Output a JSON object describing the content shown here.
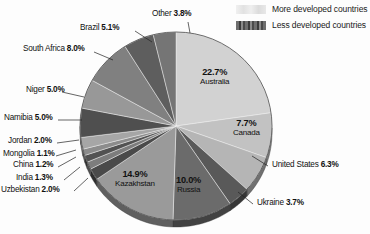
{
  "legend": {
    "position": "top-right",
    "items": [
      {
        "label": "More developed countries",
        "swatch": "light-gray-gradient"
      },
      {
        "label": "Less developed countries",
        "swatch": "dark-gray-striped"
      }
    ]
  },
  "chart_data": {
    "type": "pie",
    "title": "",
    "subtitle": "",
    "xlabel": "",
    "ylabel": "",
    "grid": false,
    "legend_position": "top-right",
    "start_angle_deg": -90,
    "direction": "clockwise",
    "total_percent": 100.0,
    "categories": [
      "Australia",
      "Canada",
      "United States",
      "Ukraine",
      "Russia",
      "Kazakhstan",
      "Uzbekistan",
      "India",
      "China",
      "Mongolia",
      "Jordan",
      "Namibia",
      "Niger",
      "South Africa",
      "Brazil",
      "Other"
    ],
    "values": [
      22.7,
      7.7,
      6.3,
      3.7,
      10.0,
      14.9,
      2.0,
      1.3,
      1.2,
      1.1,
      2.0,
      5.0,
      5.0,
      8.0,
      5.1,
      3.8
    ],
    "slices": [
      {
        "name": "Australia",
        "value": 22.7,
        "label": "22.7%",
        "group": "More developed countries",
        "color": "#d2d2d2",
        "label_placement": "inside"
      },
      {
        "name": "Canada",
        "value": 7.7,
        "label": "7.7%",
        "group": "More developed countries",
        "color": "#c2c2c2",
        "label_placement": "inside"
      },
      {
        "name": "United States",
        "value": 6.3,
        "label": "6.3%",
        "group": "More developed countries",
        "color": "#b5b5b5",
        "label_placement": "outside"
      },
      {
        "name": "Ukraine",
        "value": 3.7,
        "label": "3.7%",
        "group": "Less developed countries",
        "color": "#595959",
        "label_placement": "outside"
      },
      {
        "name": "Russia",
        "value": 10.0,
        "label": "10.0%",
        "group": "Less developed countries",
        "color": "#6b6b6b",
        "label_placement": "inside"
      },
      {
        "name": "Kazakhstan",
        "value": 14.9,
        "label": "14.9%",
        "group": "Less developed countries",
        "color": "#9a9a9a",
        "label_placement": "inside"
      },
      {
        "name": "Uzbekistan",
        "value": 2.0,
        "label": "2.0%",
        "group": "Less developed countries",
        "color": "#4a4a4a",
        "label_placement": "outside"
      },
      {
        "name": "India",
        "value": 1.3,
        "label": "1.3%",
        "group": "Less developed countries",
        "color": "#7d7d7d",
        "label_placement": "outside"
      },
      {
        "name": "China",
        "value": 1.2,
        "label": "1.2%",
        "group": "Less developed countries",
        "color": "#525252",
        "label_placement": "outside"
      },
      {
        "name": "Mongolia",
        "value": 1.1,
        "label": "1.1%",
        "group": "Less developed countries",
        "color": "#8c8c8c",
        "label_placement": "outside"
      },
      {
        "name": "Jordan",
        "value": 2.0,
        "label": "2.0%",
        "group": "Less developed countries",
        "color": "#a6a6a6",
        "label_placement": "outside"
      },
      {
        "name": "Namibia",
        "value": 5.0,
        "label": "5.0%",
        "group": "Less developed countries",
        "color": "#4f4f4f",
        "label_placement": "outside"
      },
      {
        "name": "Niger",
        "value": 5.0,
        "label": "5.0%",
        "group": "Less developed countries",
        "color": "#989898",
        "label_placement": "outside"
      },
      {
        "name": "South Africa",
        "value": 8.0,
        "label": "8.0%",
        "group": "Less developed countries",
        "color": "#808080",
        "label_placement": "outside"
      },
      {
        "name": "Brazil",
        "value": 5.1,
        "label": "5.1%",
        "group": "Less developed countries",
        "color": "#5e5e5e",
        "label_placement": "outside"
      },
      {
        "name": "Other",
        "value": 3.8,
        "label": "3.8%",
        "group": "Less developed countries",
        "color": "#757575",
        "label_placement": "outside"
      }
    ]
  },
  "labels": {
    "other": {
      "name": "Other",
      "pct": "3.8%"
    },
    "brazil": {
      "name": "Brazil",
      "pct": "5.1%"
    },
    "south_africa": {
      "name": "South Africa",
      "pct": "8.0%"
    },
    "niger": {
      "name": "Niger",
      "pct": "5.0%"
    },
    "namibia": {
      "name": "Namibia",
      "pct": "5.0%"
    },
    "jordan": {
      "name": "Jordan",
      "pct": "2.0%"
    },
    "mongolia": {
      "name": "Mongolia",
      "pct": "1.1%"
    },
    "china": {
      "name": "China",
      "pct": "1.2%"
    },
    "india": {
      "name": "India",
      "pct": "1.3%"
    },
    "uzbekistan": {
      "name": "Uzbekistan",
      "pct": "2.0%"
    },
    "united_states": {
      "name": "United States",
      "pct": "6.3%"
    },
    "ukraine": {
      "name": "Ukraine",
      "pct": "3.7%"
    },
    "australia": {
      "name": "Australia",
      "pct": "22.7%"
    },
    "canada": {
      "name": "Canada",
      "pct": "7.7%"
    },
    "russia": {
      "name": "Russia",
      "pct": "10.0%"
    },
    "kazakhstan": {
      "name": "Kazakhstan",
      "pct": "14.9%"
    }
  }
}
